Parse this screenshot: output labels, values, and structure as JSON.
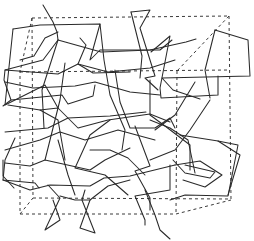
{
  "figure": {
    "width": 254,
    "height": 241,
    "colors": {
      "background": "#ffffff",
      "bond": "#2a2a2a",
      "cell": "#3a3a3a"
    }
  },
  "unit_cell": {
    "edges": [
      [
        32,
        18,
        229,
        16
      ],
      [
        229,
        16,
        231,
        200
      ],
      [
        32,
        18,
        33,
        198
      ],
      [
        20,
        70,
        20,
        214
      ],
      [
        20,
        72,
        229,
        70
      ],
      [
        229,
        16,
        177,
        71
      ],
      [
        32,
        18,
        20,
        72
      ],
      [
        20,
        214,
        176,
        214
      ],
      [
        176,
        214,
        231,
        200
      ],
      [
        33,
        198,
        231,
        199
      ],
      [
        20,
        214,
        33,
        198
      ],
      [
        177,
        71,
        176,
        214
      ]
    ]
  },
  "network": {
    "polylines": [
      [
        [
          43,
          5
        ],
        [
          53,
          22
        ],
        [
          57,
          32
        ],
        [
          58,
          40
        ],
        [
          43,
          60
        ],
        [
          5,
          70
        ],
        [
          4,
          80
        ],
        [
          11,
          100
        ],
        [
          3,
          106
        ]
      ],
      [
        [
          13,
          29
        ],
        [
          40,
          25
        ],
        [
          100,
          24
        ],
        [
          90,
          60
        ],
        [
          100,
          50
        ],
        [
          160,
          50
        ],
        [
          172,
          40
        ]
      ],
      [
        [
          13,
          29
        ],
        [
          5,
          105
        ],
        [
          45,
          85
        ],
        [
          58,
          108
        ]
      ],
      [
        [
          58,
          40
        ],
        [
          101,
          52
        ],
        [
          150,
          50
        ],
        [
          186,
          42
        ],
        [
          196,
          39
        ]
      ],
      [
        [
          80,
          38
        ],
        [
          86,
          45
        ],
        [
          78,
          64
        ],
        [
          93,
          73
        ],
        [
          130,
          72
        ]
      ],
      [
        [
          58,
          40
        ],
        [
          42,
          90
        ],
        [
          44,
          128
        ]
      ],
      [
        [
          131,
          12
        ],
        [
          150,
          10
        ],
        [
          140,
          28
        ],
        [
          155,
          76
        ],
        [
          145,
          78
        ],
        [
          158,
          90
        ]
      ],
      [
        [
          131,
          12
        ],
        [
          142,
          56
        ],
        [
          140,
          78
        ]
      ],
      [
        [
          151,
          52
        ],
        [
          170,
          36
        ],
        [
          160,
          88
        ],
        [
          161,
          98
        ],
        [
          218,
          95
        ],
        [
          218,
          76
        ]
      ],
      [
        [
          215,
          30
        ],
        [
          248,
          40
        ],
        [
          250,
          76
        ],
        [
          162,
          78
        ],
        [
          173,
          90
        ],
        [
          200,
          99
        ]
      ],
      [
        [
          215,
          30
        ],
        [
          205,
          70
        ],
        [
          210,
          98
        ]
      ],
      [
        [
          5,
          70
        ],
        [
          58,
          74
        ],
        [
          78,
          64
        ],
        [
          108,
          72
        ],
        [
          150,
          68
        ],
        [
          175,
          60
        ]
      ],
      [
        [
          5,
          82
        ],
        [
          33,
          88
        ],
        [
          75,
          86
        ],
        [
          95,
          82
        ],
        [
          130,
          92
        ],
        [
          160,
          95
        ]
      ],
      [
        [
          11,
          100
        ],
        [
          62,
          95
        ],
        [
          68,
          104
        ],
        [
          93,
          96
        ],
        [
          95,
          85
        ]
      ],
      [
        [
          40,
          110
        ],
        [
          58,
          108
        ],
        [
          78,
          128
        ],
        [
          108,
          120
        ],
        [
          150,
          114
        ],
        [
          170,
          122
        ]
      ],
      [
        [
          8,
          105
        ],
        [
          40,
          110
        ],
        [
          58,
          120
        ],
        [
          65,
          160
        ]
      ],
      [
        [
          100,
          24
        ],
        [
          104,
          60
        ],
        [
          110,
          95
        ],
        [
          125,
          130
        ],
        [
          122,
          150
        ]
      ],
      [
        [
          65,
          63
        ],
        [
          60,
          100
        ],
        [
          50,
          140
        ],
        [
          45,
          160
        ]
      ],
      [
        [
          115,
          70
        ],
        [
          120,
          102
        ],
        [
          130,
          128
        ],
        [
          155,
          128
        ],
        [
          170,
          118
        ],
        [
          175,
          128
        ]
      ],
      [
        [
          5,
          150
        ],
        [
          40,
          140
        ],
        [
          60,
          132
        ],
        [
          85,
          140
        ],
        [
          118,
          130
        ],
        [
          155,
          140
        ]
      ],
      [
        [
          5,
          163
        ],
        [
          30,
          166
        ],
        [
          45,
          160
        ],
        [
          90,
          170
        ],
        [
          105,
          160
        ],
        [
          130,
          148
        ]
      ],
      [
        [
          15,
          138
        ],
        [
          5,
          160
        ],
        [
          3,
          180
        ],
        [
          35,
          183
        ],
        [
          39,
          188
        ]
      ],
      [
        [
          3,
          180
        ],
        [
          30,
          190
        ],
        [
          50,
          185
        ],
        [
          90,
          186
        ],
        [
          104,
          178
        ],
        [
          130,
          176
        ],
        [
          175,
          165
        ]
      ],
      [
        [
          48,
          185
        ],
        [
          60,
          198
        ],
        [
          45,
          230
        ],
        [
          60,
          220
        ],
        [
          53,
          200
        ]
      ],
      [
        [
          85,
          190
        ],
        [
          82,
          200
        ],
        [
          95,
          233
        ],
        [
          80,
          228
        ],
        [
          90,
          200
        ]
      ],
      [
        [
          60,
          196
        ],
        [
          75,
          200
        ],
        [
          90,
          200
        ],
        [
          108,
          186
        ],
        [
          130,
          180
        ]
      ],
      [
        [
          135,
          126
        ],
        [
          150,
          166
        ],
        [
          135,
          171
        ],
        [
          150,
          198
        ],
        [
          150,
          210
        ]
      ],
      [
        [
          150,
          120
        ],
        [
          170,
          128
        ],
        [
          188,
          140
        ],
        [
          195,
          173
        ]
      ],
      [
        [
          170,
          165
        ],
        [
          170,
          190
        ],
        [
          135,
          196
        ],
        [
          145,
          220
        ],
        [
          145,
          225
        ]
      ],
      [
        [
          145,
          190
        ],
        [
          155,
          215
        ],
        [
          160,
          230
        ],
        [
          170,
          239
        ]
      ],
      [
        [
          180,
          135
        ],
        [
          218,
          141
        ],
        [
          238,
          145
        ],
        [
          228,
          196
        ],
        [
          185,
          195
        ],
        [
          170,
          200
        ]
      ],
      [
        [
          185,
          165
        ],
        [
          215,
          172
        ],
        [
          210,
          178
        ],
        [
          185,
          173
        ],
        [
          173,
          160
        ]
      ],
      [
        [
          218,
          141
        ],
        [
          240,
          155
        ],
        [
          228,
          195
        ]
      ],
      [
        [
          175,
          165
        ],
        [
          200,
          161
        ],
        [
          222,
          175
        ],
        [
          205,
          187
        ],
        [
          183,
          180
        ]
      ],
      [
        [
          110,
          120
        ],
        [
          90,
          135
        ],
        [
          75,
          168
        ],
        [
          105,
          175
        ],
        [
          128,
          195
        ]
      ],
      [
        [
          150,
          80
        ],
        [
          150,
          115
        ],
        [
          165,
          126
        ],
        [
          190,
          145
        ],
        [
          190,
          170
        ]
      ],
      [
        [
          210,
          100
        ],
        [
          190,
          130
        ],
        [
          175,
          150
        ],
        [
          150,
          160
        ]
      ],
      [
        [
          195,
          82
        ],
        [
          175,
          115
        ],
        [
          155,
          130
        ]
      ],
      [
        [
          5,
          132
        ],
        [
          48,
          128
        ],
        [
          68,
          118
        ],
        [
          110,
          116
        ],
        [
          146,
          112
        ]
      ],
      [
        [
          3,
          160
        ],
        [
          3,
          176
        ],
        [
          14,
          188
        ]
      ],
      [
        [
          58,
          140
        ],
        [
          68,
          175
        ],
        [
          75,
          195
        ]
      ],
      [
        [
          90,
          150
        ],
        [
          110,
          150
        ],
        [
          128,
          158
        ],
        [
          145,
          175
        ]
      ],
      [
        [
          20,
          60
        ],
        [
          34,
          56
        ],
        [
          45,
          38
        ],
        [
          58,
          32
        ]
      ]
    ]
  }
}
